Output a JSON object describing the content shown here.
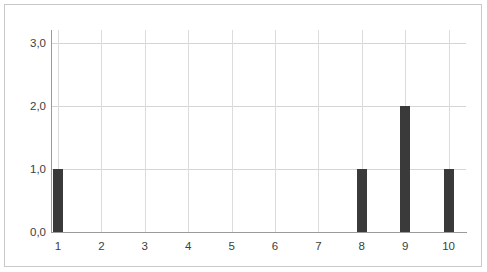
{
  "chart_data": {
    "type": "bar",
    "title": "",
    "xlabel": "",
    "ylabel": "",
    "categories": [
      "1",
      "2",
      "3",
      "4",
      "5",
      "6",
      "7",
      "8",
      "9",
      "10"
    ],
    "values": [
      1,
      0,
      0,
      0,
      0,
      0,
      0,
      1,
      2,
      1
    ],
    "series": [
      {
        "name": "",
        "values": [
          1,
          0,
          0,
          0,
          0,
          0,
          0,
          1,
          2,
          1
        ]
      }
    ],
    "ylim": [
      0,
      3.2
    ],
    "xlim": [
      0.5,
      10.5
    ],
    "y_ticks": [
      0,
      1,
      2,
      3
    ],
    "y_tick_labels": [
      "0,0",
      "1,0",
      "2,0",
      "3,0"
    ],
    "x_tick_labels": [
      "1",
      "2",
      "3",
      "4",
      "5",
      "6",
      "7",
      "8",
      "9",
      "10"
    ],
    "grid": {
      "horizontal": true,
      "vertical": true,
      "color": "#d5d5d5"
    },
    "legend": {
      "visible": false,
      "position": "none",
      "entries": []
    },
    "bar_color": "#3a3a3a",
    "background_color": "#ffffff",
    "axis_color": "#9a9a9a",
    "frame_color": "#c9c9c9",
    "decimal_separator": ","
  }
}
